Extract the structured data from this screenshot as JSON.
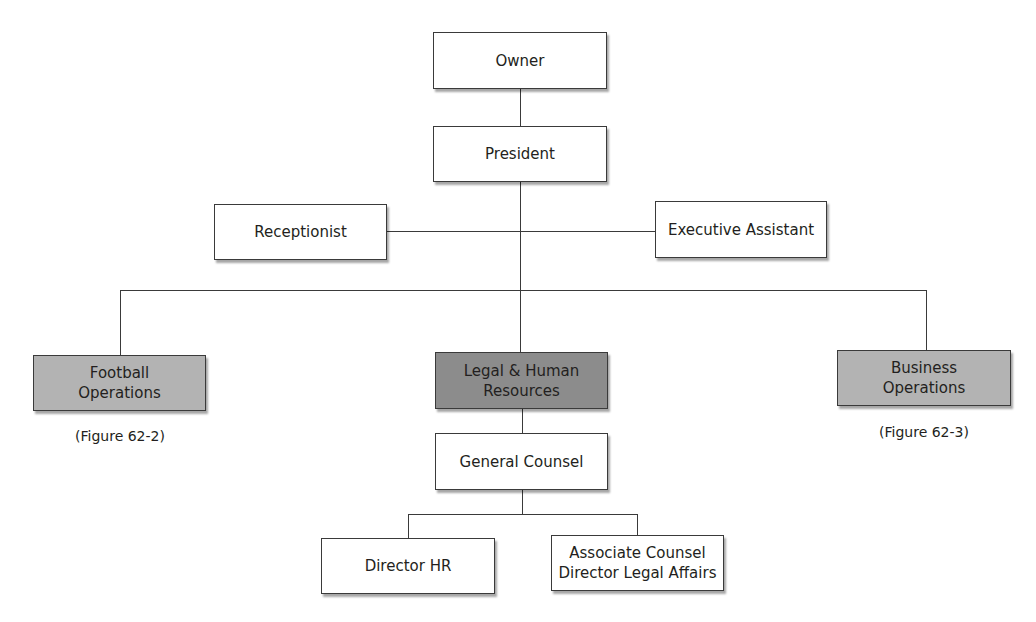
{
  "chart": {
    "nodes": {
      "owner": "Owner",
      "president": "President",
      "receptionist": "Receptionist",
      "executive_assistant": "Executive Assistant",
      "football_operations": "Football\nOperations",
      "legal_hr": "Legal & Human\nResources",
      "business_operations": "Business\nOperations",
      "general_counsel": "General Counsel",
      "director_hr": "Director HR",
      "associate_counsel": "Associate  Counsel\nDirector Legal Affairs"
    },
    "captions": {
      "football": "(Figure 62-2)",
      "business": "(Figure 62-3)"
    },
    "colors": {
      "line": "#3a3a3a",
      "division_fill": "#b3b3b3",
      "highlight_fill": "#8c8c8c",
      "box_fill": "#ffffff"
    }
  }
}
